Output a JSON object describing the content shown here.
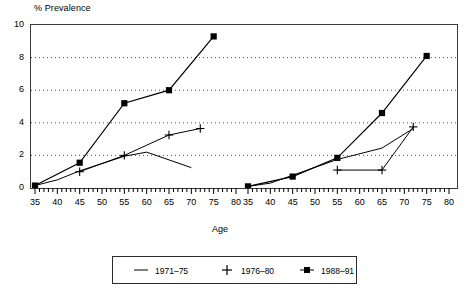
{
  "chart_data": {
    "type": "line",
    "title": "",
    "ylabel": "% Prevalence",
    "xlabel": "Age",
    "ylim": [
      0,
      10
    ],
    "yticks": [
      0,
      2,
      4,
      6,
      8,
      10
    ],
    "xlim": [
      35,
      80
    ],
    "xticks": [
      35,
      40,
      45,
      50,
      55,
      60,
      65,
      70,
      75,
      80
    ],
    "minor_tick_step": 1,
    "grid": "horizontal dotted at 2,4,6,8",
    "legend_position": "below-plot",
    "panels": [
      {
        "name": "Men",
        "label": "Men",
        "series": [
          {
            "name": "1971-75",
            "marker": "none",
            "x": [
              35,
              40,
              45,
              55,
              60,
              70
            ],
            "y": [
              0.15,
              0.5,
              1.05,
              1.95,
              2.2,
              1.25
            ]
          },
          {
            "name": "1976-80",
            "marker": "plus",
            "x": [
              45,
              55,
              65,
              72
            ],
            "y": [
              1.0,
              2.0,
              3.25,
              3.65
            ]
          },
          {
            "name": "1988-91",
            "marker": "square",
            "x": [
              35,
              45,
              55,
              65,
              75
            ],
            "y": [
              0.15,
              1.55,
              5.2,
              6.0,
              9.3
            ]
          }
        ]
      },
      {
        "name": "Women",
        "label": "Women",
        "series": [
          {
            "name": "1971-75",
            "marker": "none",
            "x": [
              35,
              40,
              55,
              65,
              72
            ],
            "y": [
              0.1,
              0.3,
              1.75,
              2.45,
              3.65
            ]
          },
          {
            "name": "1976-80",
            "marker": "plus",
            "x": [
              55,
              65,
              72
            ],
            "y": [
              1.1,
              1.1,
              3.75
            ]
          },
          {
            "name": "1988-91",
            "marker": "square",
            "x": [
              35,
              45,
              55,
              65,
              75
            ],
            "y": [
              0.1,
              0.7,
              1.85,
              4.6,
              8.1
            ]
          }
        ]
      }
    ]
  },
  "legend": {
    "items": [
      {
        "label": "1971–75",
        "marker": "line"
      },
      {
        "label": "1976–80",
        "marker": "plus"
      },
      {
        "label": "1988–91",
        "marker": "square"
      }
    ]
  },
  "axis": {
    "y_title": "% Prevalence",
    "x_title": "Age",
    "y_tick_labels": [
      "10",
      "8",
      "6",
      "4",
      "2",
      "0"
    ],
    "x_tick_labels_left": [
      "35",
      "40",
      "45",
      "50",
      "55",
      "60",
      "65",
      "70",
      "75",
      "80"
    ],
    "x_tick_labels_right": [
      "35",
      "40",
      "45",
      "50",
      "55",
      "60",
      "65",
      "70",
      "75",
      "80"
    ]
  },
  "panel_titles": {
    "men": "Men",
    "women": "Women"
  },
  "colors": {
    "ink": "#000000",
    "frame": "#3a3a3a",
    "grid": "#555555"
  }
}
